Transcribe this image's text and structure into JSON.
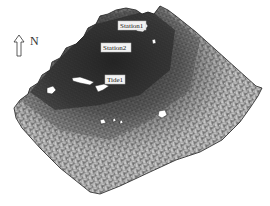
{
  "figure": {
    "type": "unstructured triangular mesh of coastal domain",
    "north_arrow": {
      "label": "N",
      "icon": "north-arrow-icon"
    },
    "stations": [
      {
        "id": "station1",
        "label": "Station1",
        "x": 128,
        "y": 17
      },
      {
        "id": "station2",
        "label": "Station2",
        "x": 118,
        "y": 44
      },
      {
        "id": "tide1",
        "label": "Tide1",
        "x": 113,
        "y": 77
      }
    ],
    "colors": {
      "dense_mesh": "#3a3a3a",
      "medium_mesh": "#6e6e6e",
      "coarse_mesh": "#9a9a9a",
      "boundary": "#222222",
      "background": "#ffffff"
    }
  }
}
